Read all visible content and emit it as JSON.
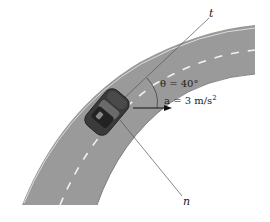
{
  "diagram": {
    "axes": {
      "tangent_label": "t",
      "normal_label": "n"
    },
    "angle": {
      "symbol": "θ",
      "text": "θ = 40°"
    },
    "acceleration": {
      "symbol": "a",
      "text": "a = 3 m/s",
      "exponent": "2"
    },
    "colors": {
      "road": "#9a9a9a",
      "road_edge": "#d8d8d8",
      "lane_marking": "#f2f2f2",
      "car_body": "#3a3a3a",
      "lines": "#444444",
      "background": "#ffffff"
    }
  }
}
